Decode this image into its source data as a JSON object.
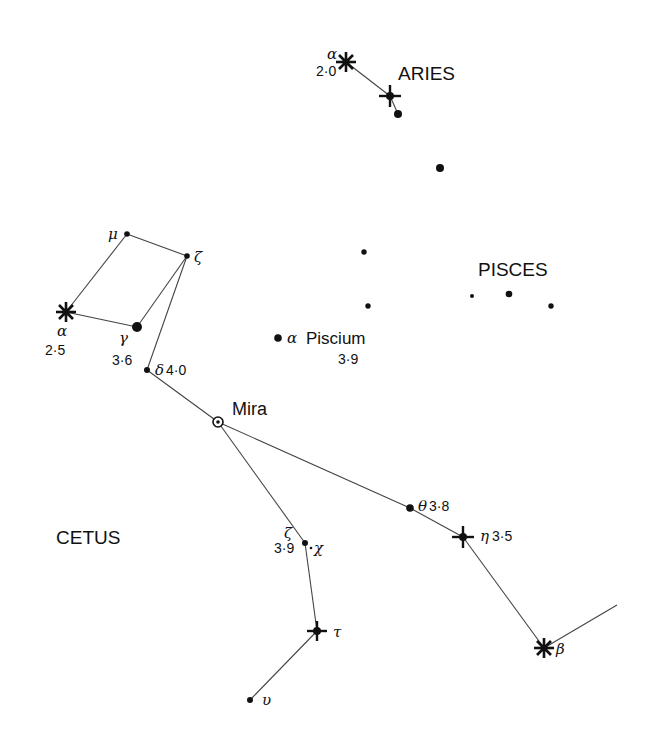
{
  "chart": {
    "constellations": [
      {
        "name": "ARIES",
        "x": 398,
        "y": 80
      },
      {
        "name": "PISCES",
        "x": 478,
        "y": 276
      },
      {
        "name": "CETUS",
        "x": 56,
        "y": 544
      }
    ],
    "stars": [
      {
        "id": "aries-alpha",
        "greek": "α",
        "mag": "2·0",
        "x": 346,
        "y": 62,
        "symbol": "asterisk"
      },
      {
        "id": "aries-beta",
        "greek": "",
        "mag": "",
        "x": 390,
        "y": 96,
        "symbol": "cross"
      },
      {
        "id": "aries-gamma",
        "greek": "",
        "mag": "",
        "x": 398,
        "y": 114,
        "symbol": "dot"
      },
      {
        "id": "pisces-1",
        "greek": "",
        "mag": "",
        "x": 440,
        "y": 168,
        "symbol": "dot"
      },
      {
        "id": "pisces-2",
        "greek": "",
        "mag": "",
        "x": 364,
        "y": 252,
        "symbol": "dot-small"
      },
      {
        "id": "pisces-3",
        "greek": "",
        "mag": "",
        "x": 368,
        "y": 306,
        "symbol": "dot-small"
      },
      {
        "id": "pisces-4",
        "greek": "",
        "mag": "",
        "x": 472,
        "y": 296,
        "symbol": "dot-small"
      },
      {
        "id": "pisces-5",
        "greek": "",
        "mag": "",
        "x": 509,
        "y": 294,
        "symbol": "dot"
      },
      {
        "id": "pisces-6",
        "greek": "",
        "mag": "",
        "x": 551,
        "y": 306,
        "symbol": "dot-small"
      },
      {
        "id": "alpha-piscium",
        "greek": "α",
        "name": "Piscium",
        "mag": "3·9",
        "x": 278,
        "y": 338,
        "symbol": "dot"
      },
      {
        "id": "cetus-alpha",
        "greek": "α",
        "mag": "2·5",
        "x": 66,
        "y": 312,
        "symbol": "asterisk"
      },
      {
        "id": "cetus-mu",
        "greek": "μ",
        "mag": "",
        "x": 127,
        "y": 234,
        "symbol": "dot-small"
      },
      {
        "id": "cetus-zeta-upper",
        "greek": "ζ",
        "mag": "",
        "x": 187,
        "y": 256,
        "symbol": "dot-small"
      },
      {
        "id": "cetus-gamma",
        "greek": "γ",
        "mag": "3·6",
        "x": 137,
        "y": 327,
        "symbol": "dot-large"
      },
      {
        "id": "cetus-delta",
        "greek": "δ",
        "mag": "4·0",
        "x": 147,
        "y": 370,
        "symbol": "dot-small"
      },
      {
        "id": "mira",
        "greek": "",
        "name": "Mira",
        "mag": "",
        "x": 218,
        "y": 422,
        "symbol": "circled-dot"
      },
      {
        "id": "cetus-theta",
        "greek": "θ",
        "mag": "3·8",
        "x": 410,
        "y": 508,
        "symbol": "dot"
      },
      {
        "id": "cetus-eta",
        "greek": "η",
        "mag": "3·5",
        "x": 463,
        "y": 537,
        "symbol": "cross"
      },
      {
        "id": "cetus-beta",
        "greek": "β",
        "mag": "",
        "x": 544,
        "y": 648,
        "symbol": "asterisk"
      },
      {
        "id": "cetus-zeta-lower",
        "greek": "ζ",
        "mag": "3·9",
        "x": 305,
        "y": 543,
        "symbol": "dot-small"
      },
      {
        "id": "cetus-chi",
        "greek": "χ",
        "mag": "",
        "x": 311,
        "y": 547,
        "symbol": "dot-tiny"
      },
      {
        "id": "cetus-tau",
        "greek": "τ",
        "mag": "",
        "x": 317,
        "y": 631,
        "symbol": "cross"
      },
      {
        "id": "cetus-upsilon",
        "greek": "υ",
        "mag": "",
        "x": 250,
        "y": 700,
        "symbol": "dot-small"
      }
    ],
    "labels": {
      "aries_alpha_greek": "α",
      "aries_alpha_mag": "2·0",
      "aries": "ARIES",
      "pisces": "PISCES",
      "cetus": "CETUS",
      "alpha_piscium_greek": "α",
      "alpha_piscium_name": "Piscium",
      "alpha_piscium_mag": "3·9",
      "cetus_alpha_greek": "α",
      "cetus_alpha_mag": "2·5",
      "mu": "μ",
      "zeta_upper": "ζ",
      "gamma": "γ",
      "gamma_mag": "3·6",
      "delta": "δ",
      "delta_mag": "4·0",
      "mira": "Mira",
      "theta": "θ",
      "theta_mag": "3·8",
      "eta": "η",
      "eta_mag": "3·5",
      "beta": "β",
      "zeta_lower": "ζ",
      "zeta_lower_mag": "3·9",
      "chi": "χ",
      "tau": "τ",
      "upsilon": "υ"
    },
    "colors": {
      "ink": "#111111",
      "line": "#444444",
      "background": "#ffffff"
    }
  }
}
